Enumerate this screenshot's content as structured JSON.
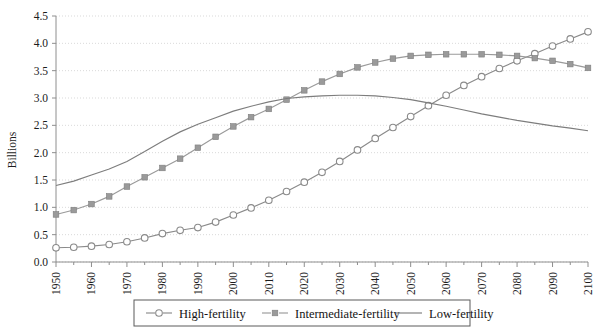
{
  "chart_data": {
    "type": "line",
    "title": "",
    "xlabel": "",
    "ylabel": "Billions",
    "xlim": [
      1950,
      2100
    ],
    "ylim": [
      0.0,
      4.5
    ],
    "grid": true,
    "legend_position": "bottom",
    "y_ticks": [
      "0.0",
      "0.5",
      "1.0",
      "1.5",
      "2.0",
      "2.5",
      "3.0",
      "3.5",
      "4.0",
      "4.5"
    ],
    "y_tick_values": [
      0.0,
      0.5,
      1.0,
      1.5,
      2.0,
      2.5,
      3.0,
      3.5,
      4.0,
      4.5
    ],
    "x_ticks": [
      "1950",
      "1960",
      "1970",
      "1980",
      "1990",
      "2000",
      "2010",
      "2020",
      "2030",
      "2040",
      "2050",
      "2060",
      "2070",
      "2080",
      "2090",
      "2100"
    ],
    "x_tick_values": [
      1950,
      1960,
      1970,
      1980,
      1990,
      2000,
      2010,
      2020,
      2030,
      2040,
      2050,
      2060,
      2070,
      2080,
      2090,
      2100
    ],
    "x": [
      1950,
      1955,
      1960,
      1965,
      1970,
      1975,
      1980,
      1985,
      1990,
      1995,
      2000,
      2005,
      2010,
      2015,
      2020,
      2025,
      2030,
      2035,
      2040,
      2045,
      2050,
      2055,
      2060,
      2065,
      2070,
      2075,
      2080,
      2085,
      2090,
      2095,
      2100
    ],
    "series": [
      {
        "name": "High-fertility",
        "marker": "circle-open",
        "color": "#8a8a8a",
        "values": [
          0.26,
          0.27,
          0.29,
          0.32,
          0.37,
          0.44,
          0.52,
          0.58,
          0.63,
          0.73,
          0.86,
          0.99,
          1.13,
          1.29,
          1.46,
          1.64,
          1.84,
          2.05,
          2.26,
          2.46,
          2.66,
          2.86,
          3.05,
          3.23,
          3.39,
          3.54,
          3.68,
          3.81,
          3.95,
          4.08,
          4.21
        ]
      },
      {
        "name": "Intermediate-fertility",
        "marker": "square-filled",
        "color": "#9a9a9a",
        "values": [
          0.87,
          0.95,
          1.06,
          1.2,
          1.38,
          1.55,
          1.72,
          1.89,
          2.09,
          2.29,
          2.48,
          2.65,
          2.8,
          2.97,
          3.14,
          3.3,
          3.44,
          3.56,
          3.65,
          3.72,
          3.77,
          3.79,
          3.8,
          3.8,
          3.8,
          3.79,
          3.77,
          3.73,
          3.68,
          3.62,
          3.55
        ]
      },
      {
        "name": "Low-fertility",
        "marker": "none",
        "color": "#7d7d7d",
        "values": [
          1.4,
          1.48,
          1.59,
          1.7,
          1.84,
          2.02,
          2.21,
          2.38,
          2.52,
          2.64,
          2.76,
          2.85,
          2.93,
          2.99,
          3.02,
          3.04,
          3.05,
          3.05,
          3.04,
          3.01,
          2.97,
          2.91,
          2.85,
          2.78,
          2.71,
          2.65,
          2.59,
          2.54,
          2.49,
          2.45,
          2.4
        ]
      }
    ]
  },
  "legend": {
    "items": [
      {
        "label": "High-fertility"
      },
      {
        "label": "Intermediate-fertility"
      },
      {
        "label": "Low-fertility"
      }
    ]
  }
}
